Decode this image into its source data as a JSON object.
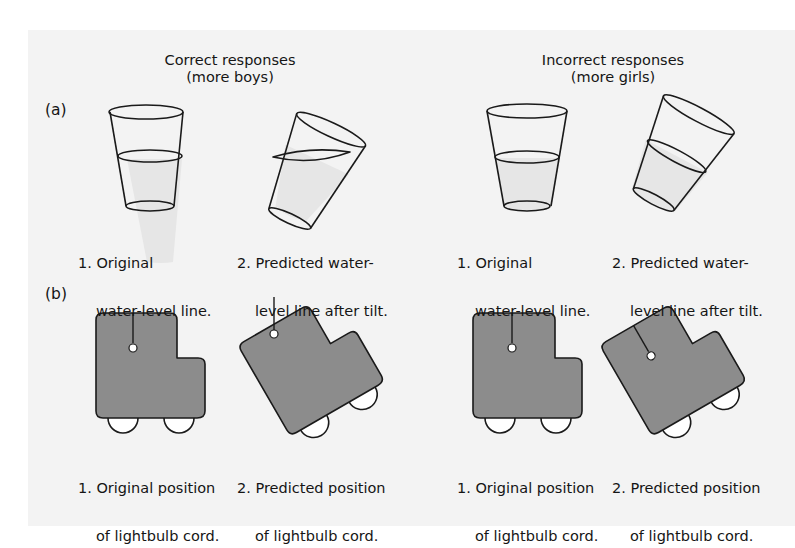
{
  "figure": {
    "columns": [
      {
        "title": "Correct responses",
        "subtitle": "(more boys)"
      },
      {
        "title": "Incorrect responses",
        "subtitle": "(more girls)"
      }
    ],
    "panels": [
      {
        "label": "(a)",
        "topic": "water-level task",
        "captions": [
          {
            "line1": "1. Original",
            "line2": "water-level line."
          },
          {
            "line1": "2. Predicted water-",
            "line2": "level line after tilt."
          },
          {
            "line1": "1. Original",
            "line2": "water-level line."
          },
          {
            "line1": "2. Predicted water-",
            "line2": "level line after tilt."
          }
        ]
      },
      {
        "label": "(b)",
        "topic": "lightbulb cord in tilted car",
        "captions": [
          {
            "line1": "1. Original position",
            "line2": "of lightbulb cord."
          },
          {
            "line1": "2. Predicted position",
            "line2": "of lightbulb cord."
          },
          {
            "line1": "1. Original position",
            "line2": "of lightbulb cord."
          },
          {
            "line1": "2. Predicted position",
            "line2": "of lightbulb cord."
          }
        ]
      }
    ],
    "colors": {
      "page_background": "#f3f3f3",
      "car_fill": "#8c8c8c",
      "water_fill": "#e6e6e6",
      "stroke": "#1a1a1a"
    }
  }
}
